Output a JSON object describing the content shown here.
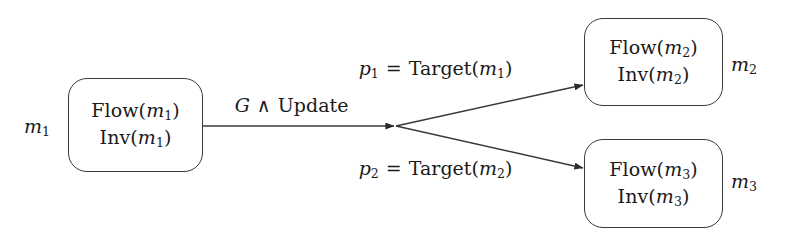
{
  "figure": {
    "type": "state-transition-diagram",
    "background_color": "#ffffff",
    "stroke_color": "#3a3a3a",
    "text_color": "#1a1a1a"
  },
  "nodes": [
    {
      "id": "m1",
      "outside_label": "m₁",
      "line1": "Flow(m₁)",
      "line2": "Inv(m₁)"
    },
    {
      "id": "m2",
      "outside_label": "m₂",
      "line1": "Flow(m₂)",
      "line2": "Inv(m₂)"
    },
    {
      "id": "m3",
      "outside_label": "m₃",
      "line1": "Flow(m₃)",
      "line2": "Inv(m₃)"
    }
  ],
  "edges": [
    {
      "id": "guard",
      "label": "G ∧ Update",
      "from": "m1",
      "to": "branch-point"
    },
    {
      "id": "target1",
      "label": "p₁ = Target(m₁)",
      "from": "branch-point",
      "to": "m2"
    },
    {
      "id": "target2",
      "label": "p₂ = Target(m₂)",
      "from": "branch-point",
      "to": "m3"
    }
  ]
}
